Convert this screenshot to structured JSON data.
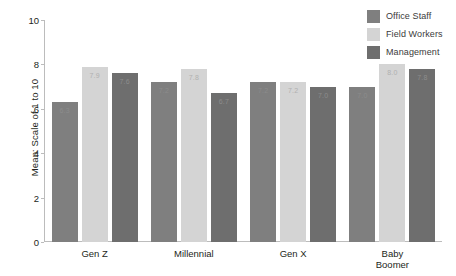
{
  "chart_data": {
    "type": "bar",
    "title": "",
    "xlabel": "",
    "ylabel": "Mean: Scale of 1 to 10",
    "ylim": [
      0,
      10
    ],
    "yticks": [
      0,
      2,
      4,
      6,
      8,
      10
    ],
    "grid": false,
    "legend_position": "top-right",
    "categories": [
      "Gen Z",
      "Millennial",
      "Gen X",
      "Baby\nBoomer"
    ],
    "series": [
      {
        "name": "Office Staff",
        "color": "#7f7f7f",
        "values": [
          6.3,
          7.2,
          7.2,
          7.0
        ]
      },
      {
        "name": "Field Workers",
        "color": "#d4d4d4",
        "values": [
          7.9,
          7.8,
          7.2,
          8.0
        ]
      },
      {
        "name": "Management",
        "color": "#6e6e6e",
        "values": [
          7.6,
          6.7,
          7.0,
          7.8
        ]
      }
    ]
  },
  "legend": {
    "items": [
      {
        "label": "Office Staff",
        "color": "#7f7f7f"
      },
      {
        "label": "Field Workers",
        "color": "#d4d4d4"
      },
      {
        "label": "Management",
        "color": "#6e6e6e"
      }
    ]
  },
  "axes": {
    "y": {
      "label": "Mean: Scale of 1 to 10",
      "ticks": [
        "0",
        "2",
        "4",
        "6",
        "8",
        "10"
      ]
    },
    "x": {
      "ticks": [
        "Gen Z",
        "Millennial",
        "Gen X",
        "Baby\nBoomer"
      ]
    }
  }
}
